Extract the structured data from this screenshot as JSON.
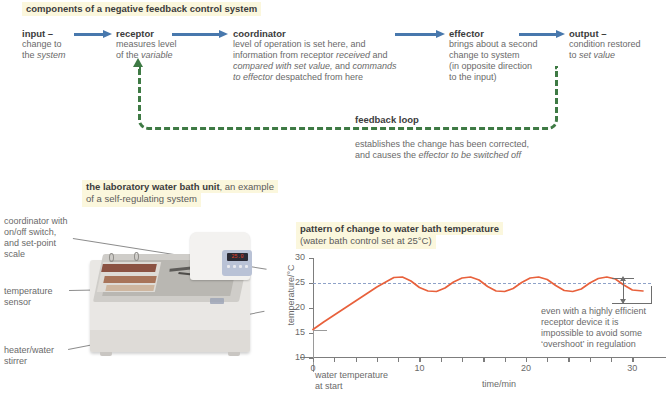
{
  "top_panel": {
    "title": "components of a negative feedback control system",
    "nodes": [
      {
        "title": "input –",
        "lines": [
          [
            "change to",
            false
          ],
          [
            "the ",
            false
          ],
          [
            "system",
            true
          ]
        ],
        "body": "change to\nthe system"
      },
      {
        "title": "receptor",
        "body": "measures level\nof the variable"
      },
      {
        "title": "coordinator",
        "body": "level of operation is set here, and\ninformation from receptor received and\ncompared with set value, and commands\nto effector despatched from here"
      },
      {
        "title": "effector",
        "body": "brings about a second\nchange to system\n(in opposite direction\nto the input)"
      },
      {
        "title": "output –",
        "body": "condition restored\nto set value"
      }
    ],
    "node_labels": {
      "input_title": "input –",
      "input_l1": "change to",
      "input_l2a": "the ",
      "input_l2b": "system",
      "receptor_title": "receptor",
      "receptor_l1": "measures level",
      "receptor_l2a": "of the ",
      "receptor_l2b": "variable",
      "coordinator_title": "coordinator",
      "coordinator_l1": "level of operation is set here, and",
      "coordinator_l2a": "information from receptor ",
      "coordinator_l2b": "received",
      "coordinator_l2c": " and",
      "coordinator_l3a": "compared with set value,",
      "coordinator_l3b": " and ",
      "coordinator_l3c": "commands",
      "coordinator_l4a": "to effector",
      "coordinator_l4b": "  despatched from here",
      "effector_title": "effector",
      "effector_l1": "brings about a second",
      "effector_l2": "change to system",
      "effector_l3": "(in opposite direction",
      "effector_l4": "to the input)",
      "output_title": "output –",
      "output_l1": "condition restored",
      "output_l2a": "to ",
      "output_l2b": "set value"
    },
    "feedback": {
      "label": "feedback loop",
      "note_l1": "establishes the change has been corrected,",
      "note_l2a": "and causes the  ",
      "note_l2b": "effector to be switched off"
    },
    "arrow_color": "#4878ad",
    "loop_color": "#3e7a44"
  },
  "waterbath": {
    "heading_bold": "the laboratory water bath unit",
    "heading_rest": ", an example",
    "heading_line2": "of a self-regulating system",
    "labels": [
      {
        "l1": "coordinator with",
        "l2": "on/off switch,",
        "l3": "and set-point",
        "l4": "scale"
      },
      {
        "l1": "temperature",
        "l2": "sensor"
      },
      {
        "l1": "heater/water",
        "l2": "stirrer"
      }
    ],
    "label_coordinator_l1": "coordinator with",
    "label_coordinator_l2": "on/off switch,",
    "label_coordinator_l3": "and set-point",
    "label_coordinator_l4": "scale",
    "label_sensor_l1": "temperature",
    "label_sensor_l2": "sensor",
    "label_heater_l1": "heater/water",
    "label_heater_l2": "stirrer",
    "display_value": "25.0"
  },
  "chart_heading": {
    "title": "pattern of change to water bath temperature",
    "subtitle": "(water bath control set at 25°C)"
  },
  "annotations": {
    "start_l1": "water temperature",
    "start_l2": "at start",
    "overshoot_l1": "even with a highly efficient",
    "overshoot_l2": "receptor device it is",
    "overshoot_l3": "impossible to avoid some",
    "overshoot_l4": "‘overshoot’ in regulation"
  },
  "chart_data": {
    "type": "line",
    "title": "pattern of change to water bath temperature",
    "subtitle": "(water bath control set at 25°C)",
    "xlabel": "time/min",
    "ylabel": "temperature/°C",
    "xlim": [
      0,
      31
    ],
    "ylim": [
      10,
      30
    ],
    "yticks": [
      10,
      15,
      20,
      25,
      30
    ],
    "xticks_major": [
      0,
      10,
      20,
      30
    ],
    "xtick_minor_step": 2,
    "grid": false,
    "legend": "none",
    "line_color": "#e8613c",
    "setpoint": 25,
    "setpoint_line_color": "#8fa2c8",
    "setpoint_line_style": "dashed",
    "start_value": 15.7,
    "series": [
      {
        "name": "water bath temperature",
        "x": [
          0,
          1,
          2,
          3,
          4,
          5,
          6,
          7,
          7.6,
          8.4,
          9.2,
          10,
          10.8,
          11.6,
          12.4,
          13.2,
          14,
          14.8,
          15.6,
          16.4,
          17.2,
          18,
          18.8,
          19.6,
          20.4,
          21.2,
          22,
          22.8,
          23.6,
          24.4,
          25.2,
          26,
          26.8,
          27.6,
          28.4,
          29.2,
          30,
          31
        ],
        "y": [
          15.7,
          17.2,
          18.6,
          20.0,
          21.4,
          22.8,
          24.2,
          25.4,
          26.1,
          26.2,
          25.4,
          24.1,
          23.4,
          23.3,
          24.0,
          25.2,
          26.0,
          26.2,
          25.6,
          24.3,
          23.4,
          23.3,
          23.9,
          25.1,
          26.0,
          26.2,
          25.7,
          24.5,
          23.5,
          23.3,
          23.8,
          25.0,
          25.9,
          26.2,
          25.8,
          24.6,
          23.6,
          23.4
        ]
      }
    ],
    "annotations": [
      {
        "text": "water temperature at start",
        "x": 0,
        "y": 15.7
      },
      {
        "text": "even with a highly efficient receptor device it is impossible to avoid some ‘overshoot’ in regulation",
        "type": "overshoot-bracket",
        "y_range": [
          23.4,
          26.2
        ]
      }
    ]
  }
}
